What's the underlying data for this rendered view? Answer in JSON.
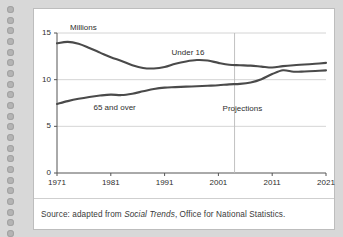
{
  "page": {
    "binding_hole_count": 22
  },
  "figure": {
    "source_prefix": "Source: adapted from ",
    "source_italic": "Social Trends",
    "source_suffix": ", Office for National Statistics."
  },
  "chart_data": {
    "type": "line",
    "title": "",
    "xlabel": "",
    "ylabel": "Millions",
    "ylim": [
      0,
      15
    ],
    "xlim": [
      1971,
      2021
    ],
    "yticks": [
      "0",
      "5",
      "10",
      "15"
    ],
    "ytick_values": [
      0,
      5,
      10,
      15
    ],
    "xticks": [
      "1971",
      "1981",
      "1991",
      "2001",
      "2011",
      "2021"
    ],
    "xtick_values": [
      1971,
      1981,
      1991,
      2001,
      2011,
      2021
    ],
    "grid": "horizontal",
    "legend": "inline-labels",
    "line_color": "#4a4a4a",
    "grid_color": "#c9c9c9",
    "axis_color": "#555555",
    "annotations": [
      {
        "name": "under-16-label",
        "text": "Under 16",
        "x": 1996,
        "y": 12.9
      },
      {
        "name": "65-and-over-label",
        "text": "65 and over",
        "x": 1981.5,
        "y": 7.0
      },
      {
        "name": "projections-label",
        "text": "Projections",
        "x": 2005.5,
        "y": 6.9
      }
    ],
    "projection_divider": {
      "x": 2004,
      "label": "Projections"
    },
    "x": [
      1971,
      1973,
      1975,
      1977,
      1979,
      1981,
      1983,
      1985,
      1987,
      1989,
      1991,
      1993,
      1995,
      1997,
      1999,
      2001,
      2003,
      2005,
      2007,
      2009,
      2011,
      2013,
      2015,
      2017,
      2019,
      2021
    ],
    "series": [
      {
        "name": "Under 16",
        "values": [
          13.9,
          14.05,
          13.85,
          13.4,
          12.9,
          12.4,
          12.0,
          11.55,
          11.25,
          11.2,
          11.35,
          11.7,
          11.95,
          12.1,
          12.05,
          11.8,
          11.6,
          11.55,
          11.5,
          11.4,
          11.3,
          11.45,
          11.55,
          11.62,
          11.7,
          11.8
        ]
      },
      {
        "name": "65 and over",
        "values": [
          7.4,
          7.7,
          7.95,
          8.15,
          8.3,
          8.4,
          8.35,
          8.5,
          8.75,
          9.0,
          9.15,
          9.2,
          9.25,
          9.3,
          9.35,
          9.4,
          9.5,
          9.55,
          9.7,
          10.05,
          10.6,
          11.0,
          10.85,
          10.88,
          10.93,
          11.0
        ]
      }
    ]
  }
}
